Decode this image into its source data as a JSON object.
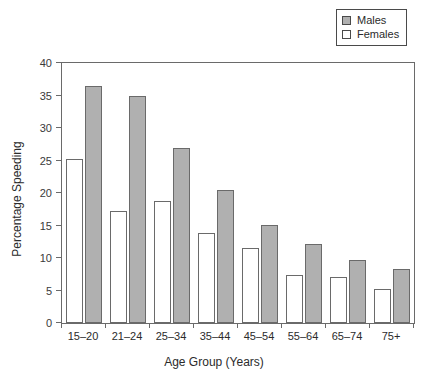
{
  "chart_data": {
    "type": "bar",
    "title": "",
    "xlabel": "Age Group (Years)",
    "ylabel": "Percentage Speeding",
    "categories": [
      "15–20",
      "21–24",
      "25–34",
      "35–44",
      "45–54",
      "55–64",
      "65–74",
      "75+"
    ],
    "series": [
      {
        "name": "Males",
        "color": "#b0b0b0",
        "values": [
          36.5,
          35.0,
          27.0,
          20.5,
          15.1,
          12.2,
          9.7,
          8.3
        ]
      },
      {
        "name": "Females",
        "color": "#ffffff",
        "values": [
          25.2,
          17.2,
          18.8,
          13.9,
          11.6,
          7.4,
          7.1,
          5.2
        ]
      }
    ],
    "ylim": [
      0,
      40
    ],
    "yticks": [
      0,
      5,
      10,
      15,
      20,
      25,
      30,
      35,
      40
    ],
    "ytick_labels": [
      "0",
      "5",
      "10",
      "15",
      "20",
      "25",
      "30",
      "35",
      "40"
    ],
    "grid": false,
    "legend_position": "top-right",
    "frame": true,
    "bar_order": [
      "Females",
      "Males"
    ]
  },
  "legend": {
    "items": [
      {
        "label": "Males",
        "swatch": "filled-gray-swatch"
      },
      {
        "label": "Females",
        "swatch": "empty-white-swatch"
      }
    ]
  }
}
